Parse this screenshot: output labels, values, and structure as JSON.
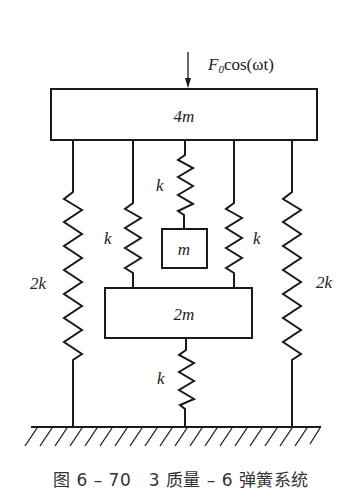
{
  "diagram": {
    "force_label_main": "F",
    "force_label_sub": "0",
    "force_label_rest": "cos(ωt)",
    "masses": [
      {
        "id": "top",
        "label": "4m"
      },
      {
        "id": "small",
        "label": "m"
      },
      {
        "id": "middle",
        "label": "2m"
      }
    ],
    "springs": [
      {
        "id": "left-outer",
        "label": "2k",
        "connects": [
          "4m",
          "ground"
        ]
      },
      {
        "id": "left-inner",
        "label": "k",
        "connects": [
          "4m",
          "2m"
        ]
      },
      {
        "id": "center-top",
        "label": "k",
        "connects": [
          "4m",
          "m"
        ]
      },
      {
        "id": "right-inner",
        "label": "k",
        "connects": [
          "4m",
          "2m"
        ]
      },
      {
        "id": "right-outer",
        "label": "2k",
        "connects": [
          "4m",
          "ground"
        ]
      },
      {
        "id": "center-bottom",
        "label": "k",
        "connects": [
          "2m",
          "ground"
        ]
      }
    ],
    "ground_label": "ground"
  },
  "caption": "图 6 – 70　3 质量 – 6 弹簧系统"
}
